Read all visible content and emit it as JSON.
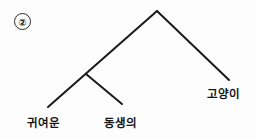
{
  "diagram": {
    "type": "syntax-tree",
    "item_number": "②",
    "background_color": "#fdfdfd",
    "line_color": "#1a1a1a",
    "line_width": 2,
    "text_color": "#161616",
    "nodes": {
      "root": {
        "x": 157,
        "y": 11
      },
      "left_internal": {
        "x": 86,
        "y": 74
      }
    },
    "edges": [
      {
        "name": "root-to-left-leaf",
        "x1": 157,
        "y1": 11,
        "x2": 48,
        "y2": 107
      },
      {
        "name": "root-to-right-leaf",
        "x1": 157,
        "y1": 11,
        "x2": 229,
        "y2": 80
      },
      {
        "name": "internal-to-middle-leaf",
        "x1": 86,
        "y1": 74,
        "x2": 122,
        "y2": 104
      }
    ],
    "leaves": [
      {
        "id": "leaf-1",
        "text": "귀여운",
        "x": 27,
        "y": 114
      },
      {
        "id": "leaf-2",
        "text": "동생의",
        "x": 104,
        "y": 114
      },
      {
        "id": "leaf-3",
        "text": "고양이",
        "x": 207,
        "y": 85
      }
    ]
  }
}
